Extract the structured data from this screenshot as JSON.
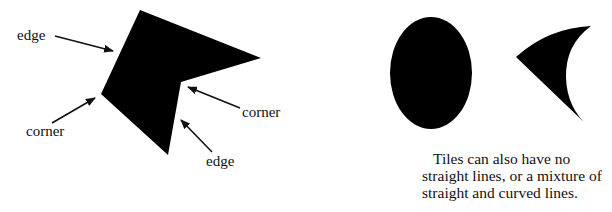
{
  "labels": {
    "edge_top": "edge",
    "corner_left": "corner",
    "corner_right": "corner",
    "edge_bottom": "edge"
  },
  "caption": {
    "line1": "Tiles can also have no",
    "line2": "straight lines, or a mixture of",
    "line3": "straight and curved lines."
  },
  "colors": {
    "shape_fill": "#000000",
    "background": "#ffffff"
  }
}
